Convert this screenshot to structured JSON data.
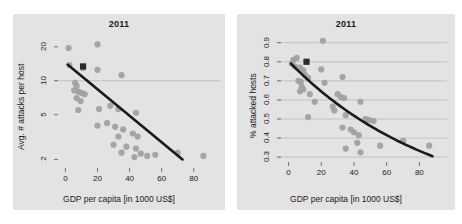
{
  "figure": {
    "background": "#ffffff",
    "panel_background": "#e3e3e3",
    "point_color": "#a0a0a0",
    "highlight_color": "#2b2b2b",
    "trend_color": "#1a1a1a",
    "grid_color": "#b5b5b5"
  },
  "panels": [
    {
      "id": "left",
      "title": "2011",
      "xlabel": "GDP per capita [in 1000 US$]",
      "ylabel": "Avg. # attacks per host",
      "xticks": [
        "0",
        "20",
        "40",
        "60",
        "80"
      ],
      "yticks": [
        "2",
        "5",
        "10",
        "20"
      ]
    },
    {
      "id": "right",
      "title": "2011",
      "xlabel": "GDP per capita [in 1000 US$]",
      "ylabel": "% attacked hosts",
      "xticks": [
        "0",
        "20",
        "40",
        "60",
        "80"
      ],
      "yticks": [
        "0.3",
        "0.4",
        "0.5",
        "0.6",
        "0.7",
        "0.8",
        "0.9"
      ]
    }
  ],
  "chart_data": [
    {
      "type": "scatter",
      "panel": "left",
      "title": "2011",
      "xlabel": "GDP per capita [in 1000 US$]",
      "ylabel": "Avg. # attacks per host",
      "xlim": [
        -4,
        92
      ],
      "ylim": [
        1.75,
        23
      ],
      "yscale": "log",
      "xscale": "linear",
      "xticks": [
        0,
        20,
        40,
        60,
        80
      ],
      "yticks": [
        2,
        5,
        10,
        20
      ],
      "grid": "horizontal gridline at y=10 only",
      "legend": "none",
      "series": [
        {
          "name": "countries",
          "marker": "circle",
          "color": "#a0a0a0",
          "points": [
            [
              2,
              19.5
            ],
            [
              20,
              21.0
            ],
            [
              2.5,
              13.8
            ],
            [
              11,
              13.0
            ],
            [
              20,
              12.5
            ],
            [
              35,
              11.2
            ],
            [
              6,
              9.6
            ],
            [
              7,
              9.0
            ],
            [
              5.5,
              8.2
            ],
            [
              8,
              8.0
            ],
            [
              10,
              7.8
            ],
            [
              12,
              7.6
            ],
            [
              7,
              7.0
            ],
            [
              9.5,
              6.6
            ],
            [
              8,
              5.5
            ],
            [
              21,
              5.6
            ],
            [
              28,
              6.0
            ],
            [
              33,
              5.6
            ],
            [
              44,
              5.2
            ],
            [
              20,
              4.0
            ],
            [
              26,
              4.2
            ],
            [
              31,
              3.9
            ],
            [
              36,
              3.7
            ],
            [
              33,
              3.2
            ],
            [
              42,
              3.4
            ],
            [
              45,
              3.2
            ],
            [
              30,
              2.7
            ],
            [
              38,
              2.6
            ],
            [
              44,
              2.5
            ],
            [
              35,
              2.3
            ],
            [
              43,
              2.1
            ],
            [
              47,
              2.25
            ],
            [
              51,
              2.15
            ],
            [
              56,
              2.2
            ],
            [
              70,
              2.3
            ],
            [
              86,
              2.15
            ]
          ]
        },
        {
          "name": "highlighted country",
          "marker": "square",
          "color": "#2b2b2b",
          "points": [
            [
              11,
              13.4
            ]
          ]
        }
      ],
      "trend": {
        "type": "linear-on-log",
        "color": "#1a1a1a",
        "from": [
          1.5,
          13.9
        ],
        "to": [
          73,
          2.0
        ]
      }
    },
    {
      "type": "scatter",
      "panel": "right",
      "title": "2011",
      "xlabel": "GDP per capita [in 1000 US$]",
      "ylabel": "% attacked hosts",
      "xlim": [
        -4,
        92
      ],
      "ylim": [
        0.285,
        0.935
      ],
      "yscale": "linear",
      "xscale": "linear",
      "xticks": [
        0,
        20,
        40,
        60,
        80
      ],
      "yticks": [
        0.3,
        0.4,
        0.5,
        0.6,
        0.7,
        0.8,
        0.9
      ],
      "grid": "horizontal gridlines at every 0.1 tick",
      "legend": "none",
      "series": [
        {
          "name": "countries",
          "marker": "circle",
          "color": "#a0a0a0",
          "points": [
            [
              21,
              0.91
            ],
            [
              3,
              0.81
            ],
            [
              5,
              0.82
            ],
            [
              2,
              0.79
            ],
            [
              4,
              0.775
            ],
            [
              7,
              0.77
            ],
            [
              9,
              0.755
            ],
            [
              20,
              0.76
            ],
            [
              10,
              0.73
            ],
            [
              12,
              0.715
            ],
            [
              6,
              0.7
            ],
            [
              7.5,
              0.695
            ],
            [
              22,
              0.69
            ],
            [
              33,
              0.72
            ],
            [
              8,
              0.67
            ],
            [
              9,
              0.655
            ],
            [
              7,
              0.645
            ],
            [
              13,
              0.63
            ],
            [
              30,
              0.63
            ],
            [
              32,
              0.615
            ],
            [
              34,
              0.61
            ],
            [
              16,
              0.59
            ],
            [
              44,
              0.59
            ],
            [
              27,
              0.565
            ],
            [
              28,
              0.545
            ],
            [
              12,
              0.51
            ],
            [
              35,
              0.52
            ],
            [
              47,
              0.5
            ],
            [
              49,
              0.495
            ],
            [
              52,
              0.49
            ],
            [
              33,
              0.455
            ],
            [
              38,
              0.445
            ],
            [
              40,
              0.43
            ],
            [
              43,
              0.415
            ],
            [
              35,
              0.345
            ],
            [
              44,
              0.325
            ],
            [
              42,
              0.375
            ],
            [
              56,
              0.36
            ],
            [
              70,
              0.385
            ],
            [
              86,
              0.36
            ]
          ]
        },
        {
          "name": "highlighted country",
          "marker": "square",
          "color": "#2b2b2b",
          "points": [
            [
              11,
              0.8
            ]
          ]
        }
      ],
      "trend": {
        "type": "decaying-curve",
        "color": "#1a1a1a",
        "from": [
          1.5,
          0.79
        ],
        "to": [
          88,
          0.305
        ]
      }
    }
  ]
}
